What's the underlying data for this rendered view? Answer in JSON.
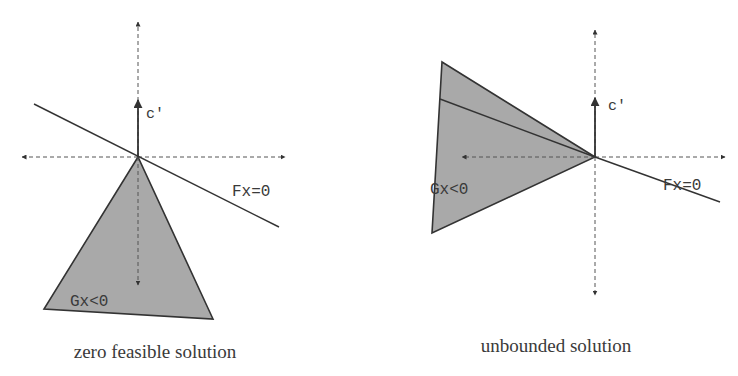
{
  "colors": {
    "ink": "#333333",
    "axis": "#555555",
    "fill": "#a9a9a9",
    "background": "#ffffff"
  },
  "panels": [
    {
      "id": "zero-feasible",
      "caption": "zero feasible solution",
      "objective_label": "c′",
      "constraint_line_label": "Fx=0",
      "region_label": "Gx<0",
      "origin": [
        138,
        157
      ],
      "axes": {
        "top": 22,
        "bottom": 285,
        "left": 22,
        "right": 285
      },
      "c_arrow_tip": [
        138,
        100
      ],
      "fx_line": [
        [
          34,
          104
        ],
        [
          279,
          227
        ]
      ],
      "region": [
        [
          138,
          157
        ],
        [
          44,
          309
        ],
        [
          213,
          319
        ]
      ],
      "fx_label_pos": [
        232,
        196
      ],
      "gx_label_pos": [
        70,
        306
      ],
      "c_label_pos": [
        146,
        118
      ],
      "caption_pos": [
        155,
        358
      ]
    },
    {
      "id": "unbounded",
      "caption": "unbounded solution",
      "objective_label": "c′",
      "constraint_line_label": "Fx=0",
      "region_label": "Gx<0",
      "origin": [
        595,
        157
      ],
      "axes": {
        "top": 30,
        "bottom": 295,
        "left": 462,
        "right": 725
      },
      "c_arrow_tip": [
        595,
        98
      ],
      "fx_line": [
        [
          595,
          157
        ],
        [
          720,
          202
        ]
      ],
      "inner_line": [
        [
          440,
          99
        ],
        [
          595,
          157
        ]
      ],
      "region": [
        [
          442,
          62
        ],
        [
          595,
          157
        ],
        [
          432,
          233
        ]
      ],
      "fx_label_pos": [
        663,
        190
      ],
      "gx_label_pos": [
        430,
        194
      ],
      "c_label_pos": [
        608,
        110
      ],
      "caption_pos": [
        556,
        352
      ]
    }
  ]
}
